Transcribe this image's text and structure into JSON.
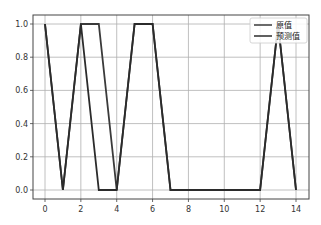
{
  "chart_data": {
    "type": "line",
    "title": "",
    "xlabel": "",
    "ylabel": "",
    "x": [
      0,
      1,
      2,
      3,
      4,
      5,
      6,
      7,
      8,
      9,
      10,
      11,
      12,
      13,
      14
    ],
    "series": [
      {
        "name": "原值",
        "color": "#3a3a3a",
        "values": [
          1,
          0,
          1,
          1,
          0,
          1,
          1,
          0,
          0,
          0,
          0,
          0,
          0,
          1,
          0
        ]
      },
      {
        "name": "预测值",
        "color": "#2b2b2b",
        "values": [
          1,
          0,
          1,
          0,
          0,
          1,
          1,
          0,
          0,
          0,
          0,
          0,
          0,
          1,
          0
        ]
      }
    ],
    "xlim": [
      -0.7,
      14.7
    ],
    "ylim": [
      -0.05,
      1.05
    ],
    "xticks": [
      0,
      2,
      4,
      6,
      8,
      10,
      12,
      14
    ],
    "xtick_labels": [
      "0",
      "2",
      "4",
      "6",
      "8",
      "10",
      "12",
      "14"
    ],
    "yticks": [
      0.0,
      0.2,
      0.4,
      0.6,
      0.8,
      1.0
    ],
    "ytick_labels": [
      "0.0",
      "0.2",
      "0.4",
      "0.6",
      "0.8",
      "1.0"
    ],
    "grid": true,
    "legend_position": "upper right"
  }
}
